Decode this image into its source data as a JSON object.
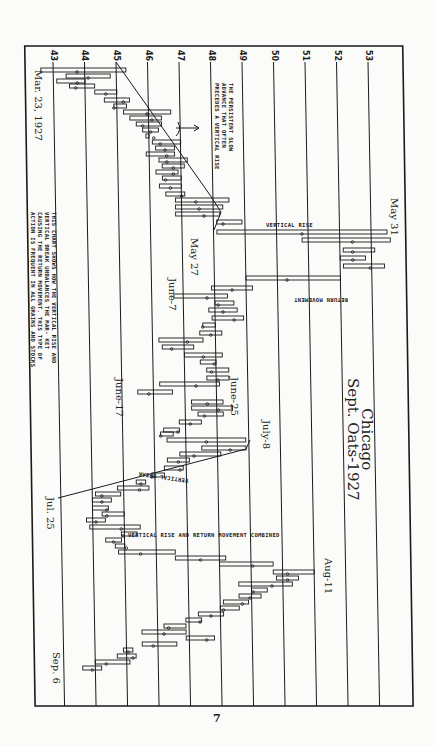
{
  "chart_data": {
    "type": "bar",
    "orientation": "rotated-90 (price on horizontal axis, time runs downward)",
    "title": "Chicago Sept. Oats-1927",
    "xlabel": "",
    "ylabel": "",
    "price_ticks": [
      43,
      44,
      45,
      46,
      47,
      48,
      49,
      50,
      51,
      52,
      53
    ],
    "price_range": [
      42,
      54
    ],
    "grid": true,
    "date_labels": [
      {
        "text": "Mar. 23, 1927",
        "y": 70
      },
      {
        "text": "May 27",
        "y": 245
      },
      {
        "text": "May 31",
        "y": 200
      },
      {
        "text": "June-7",
        "y": 280
      },
      {
        "text": "June-17",
        "y": 380
      },
      {
        "text": "June-25",
        "y": 375
      },
      {
        "text": "July-8",
        "y": 420
      },
      {
        "text": "Jul. 25",
        "y": 495
      },
      {
        "text": "Aug-11",
        "y": 560
      },
      {
        "text": "Sep. 6",
        "y": 655
      }
    ],
    "bars": [
      [
        70,
        42.6,
        45.3
      ],
      [
        76,
        43.4,
        44.8
      ],
      [
        81,
        43.1,
        44.0
      ],
      [
        86,
        43.5,
        44.3
      ],
      [
        92,
        44.3,
        45.0
      ],
      [
        100,
        44.6,
        45.4
      ],
      [
        106,
        44.9,
        45.3
      ],
      [
        112,
        45.2,
        46.7
      ],
      [
        118,
        45.4,
        46.4
      ],
      [
        124,
        45.6,
        46.4
      ],
      [
        130,
        45.8,
        46.3
      ],
      [
        136,
        45.9,
        46.0
      ],
      [
        142,
        46.1,
        47.0
      ],
      [
        148,
        46.2,
        46.8
      ],
      [
        154,
        45.9,
        46.8
      ],
      [
        160,
        46.3,
        47.2
      ],
      [
        166,
        46.4,
        47.1
      ],
      [
        172,
        46.2,
        46.9
      ],
      [
        178,
        46.4,
        47.0
      ],
      [
        186,
        46.3,
        47.0
      ],
      [
        194,
        46.5,
        47.1
      ],
      [
        200,
        46.8,
        48.5
      ],
      [
        207,
        46.8,
        48.3
      ],
      [
        214,
        46.8,
        48.2
      ],
      [
        222,
        48.1,
        48.9
      ],
      [
        232,
        48.1,
        53.5
      ],
      [
        240,
        50.8,
        53.6
      ],
      [
        250,
        52.1,
        53.1
      ],
      [
        258,
        52.0,
        52.8
      ],
      [
        266,
        52.1,
        53.4
      ],
      [
        278,
        49.0,
        52.0
      ],
      [
        288,
        47.9,
        49.2
      ],
      [
        296,
        46.7,
        48.4
      ],
      [
        303,
        48.0,
        48.6
      ],
      [
        310,
        47.8,
        48.7
      ],
      [
        318,
        47.9,
        48.9
      ],
      [
        325,
        47.6,
        48.0
      ],
      [
        333,
        47.5,
        48.2
      ],
      [
        340,
        46.2,
        47.6
      ],
      [
        347,
        46.3,
        47.3
      ],
      [
        355,
        47.0,
        48.2
      ],
      [
        362,
        47.5,
        48.0
      ],
      [
        370,
        47.7,
        48.4
      ],
      [
        378,
        47.7,
        48.4
      ],
      [
        384,
        46.2,
        48.1
      ],
      [
        392,
        45.5,
        46.6
      ],
      [
        402,
        47.2,
        48.2
      ],
      [
        408,
        47.2,
        48.5
      ],
      [
        414,
        47.4,
        48.2
      ],
      [
        422,
        46.8,
        47.5
      ],
      [
        430,
        46.3,
        46.8
      ],
      [
        434,
        46.2,
        46.6
      ],
      [
        440,
        46.4,
        48.9
      ],
      [
        448,
        47.5,
        48.9
      ],
      [
        454,
        46.8,
        48.1
      ],
      [
        460,
        46.4,
        47.1
      ],
      [
        468,
        46.3,
        46.9
      ],
      [
        475,
        45.9,
        46.3
      ],
      [
        482,
        45.4,
        45.7
      ],
      [
        488,
        44.8,
        45.8
      ],
      [
        494,
        44.1,
        44.9
      ],
      [
        500,
        44.0,
        44.6
      ],
      [
        508,
        44.0,
        44.5
      ],
      [
        514,
        44.3,
        45.0
      ],
      [
        520,
        43.8,
        44.4
      ],
      [
        527,
        43.9,
        45.5
      ],
      [
        534,
        44.9,
        45.4
      ],
      [
        540,
        44.4,
        44.9
      ],
      [
        546,
        44.7,
        45.0
      ],
      [
        552,
        44.8,
        46.6
      ],
      [
        558,
        46.6,
        48.2
      ],
      [
        564,
        48.0,
        49.7
      ],
      [
        572,
        49.7,
        51.0
      ],
      [
        578,
        49.8,
        50.5
      ],
      [
        584,
        48.6,
        50.3
      ],
      [
        590,
        49.0,
        49.5
      ],
      [
        596,
        48.6,
        49.3
      ],
      [
        602,
        48.1,
        48.9
      ],
      [
        608,
        48.0,
        48.6
      ],
      [
        614,
        47.3,
        48.1
      ],
      [
        620,
        46.9,
        47.4
      ],
      [
        626,
        46.2,
        46.9
      ],
      [
        632,
        45.5,
        46.9
      ],
      [
        638,
        46.9,
        47.8
      ],
      [
        644,
        45.5,
        46.6
      ],
      [
        650,
        44.9,
        45.2
      ],
      [
        656,
        44.7,
        45.3
      ],
      [
        662,
        44.0,
        45.1
      ],
      [
        668,
        43.6,
        44.2
      ]
    ]
  },
  "annotations": {
    "slow_advance": "THE PERSISTENT SLOW ADVANCE THAT OFTEN PRECEDES A VERTICAL RISE",
    "chart_note": [
      "THIS CHART SHOWS HOW THE VERTICAL RISE",
      "AND VERTICAL BREAK UNBALANCES THE MAR-",
      "KET CAUSING THE RETURN MOVEMENT. THIS",
      "TYPE OF ACTION IS FREQUENT IN ALL GRAINS",
      "AND STOCKS"
    ],
    "vertical_rise": "VERTICAL RISE",
    "return_movement": "RETURN MOVEMENT",
    "vertical_break": "VERTICAL BREAK",
    "combined": "VERTICAL RISE AND RETURN MOVEMENT COMBINED"
  },
  "title_lines": [
    "Chicago",
    "Sept. Oats-1927"
  ],
  "page_number": "7",
  "colors": {
    "ink": "#1a1a1a",
    "paper": "#fbfbf9"
  }
}
